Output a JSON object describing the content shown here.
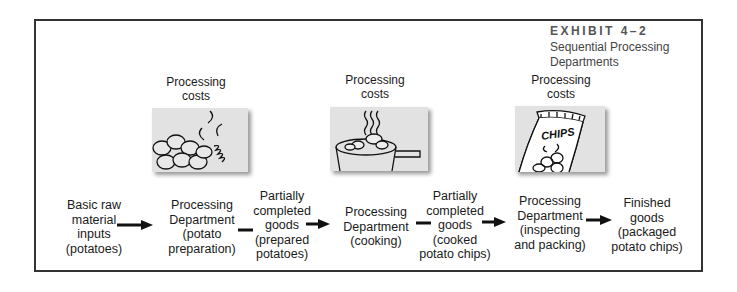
{
  "exhibit": {
    "number": "EXHIBIT 4–2",
    "title": "Sequential Processing Departments"
  },
  "cost_labels": [
    "Processing costs",
    "Processing costs",
    "Processing costs"
  ],
  "illustrations": [
    {
      "icon": "potatoes-icon",
      "caption": ""
    },
    {
      "icon": "cooking-pot-icon",
      "caption": ""
    },
    {
      "icon": "chips-bag-icon",
      "caption": "CHIPS"
    }
  ],
  "flow": [
    {
      "id": "raw-inputs",
      "lines": [
        "Basic raw",
        "material",
        "inputs",
        "(potatoes)"
      ]
    },
    {
      "id": "dept-preparation",
      "lines": [
        "Processing",
        "Department",
        "(potato",
        "preparation)"
      ]
    },
    {
      "id": "wip-prepared",
      "lines": [
        "Partially",
        "completed",
        "goods",
        "(prepared",
        "potatoes)"
      ]
    },
    {
      "id": "dept-cooking",
      "lines": [
        "Processing",
        "Department",
        "(cooking)"
      ]
    },
    {
      "id": "wip-cooked",
      "lines": [
        "Partially",
        "completed",
        "goods",
        "(cooked",
        "potato chips)"
      ]
    },
    {
      "id": "dept-packing",
      "lines": [
        "Processing",
        "Department",
        "(inspecting",
        "and packing)"
      ]
    },
    {
      "id": "finished-goods",
      "lines": [
        "Finished",
        "goods",
        "(packaged",
        "potato chips)"
      ]
    }
  ]
}
